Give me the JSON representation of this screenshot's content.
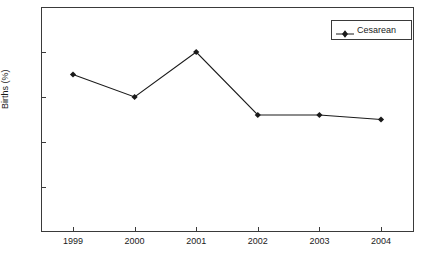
{
  "chart_data": {
    "type": "line",
    "title": "",
    "subtitle": "",
    "xlabel": "",
    "ylabel": "Births (%)",
    "categories": [
      "1999",
      "2000",
      "2001",
      "2002",
      "2003",
      "2004"
    ],
    "x": [
      1999,
      2000,
      2001,
      2002,
      2003,
      2004
    ],
    "series": [
      {
        "name": "Cesarean",
        "values": [
          17.5,
          15.0,
          20.0,
          13.0,
          13.0,
          12.5
        ],
        "color": "#1a1a1a",
        "marker": "diamond",
        "line_style": "solid"
      }
    ],
    "xlim": [
      1998.48,
      1004.52
    ],
    "ylim": [
      0,
      25
    ],
    "yticks": [
      5,
      10,
      15,
      20,
      25
    ],
    "ytick_labels": [
      "5",
      "10",
      "15",
      "20",
      "25"
    ],
    "xticks": [
      1999,
      2000,
      2001,
      2002,
      2003,
      2004
    ],
    "xtick_labels": [
      "1999",
      "2000",
      "2001",
      "2002",
      "2003",
      "2004"
    ],
    "grid": false,
    "legend": {
      "visible": true,
      "position": "top-right",
      "entries": [
        "Cesarean"
      ]
    },
    "axis_color": "#3a3a3a",
    "background": "#ffffff"
  }
}
